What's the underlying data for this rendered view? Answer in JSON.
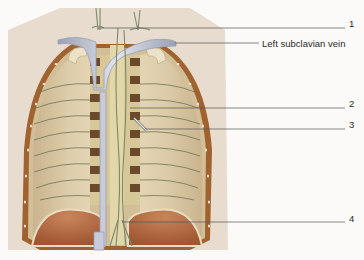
{
  "figure": {
    "colors": {
      "background": "#fbfaf8",
      "backdrop": "#e7dccd",
      "pleura": "#d9c8a6",
      "pleura_dark": "#c8b38c",
      "rib_border": "#a0622e",
      "vein": "#c9ccd8",
      "vein_shadow": "#9aa0b4",
      "vertebra_dark": "#6a4a2a",
      "spine": "#d7c89a",
      "diaphragm": "#b56c3e",
      "nerve": "#5a6a4a",
      "leader_line": "#555555"
    }
  },
  "labels": [
    {
      "id": "1",
      "text": "1",
      "x": 349,
      "y": 19,
      "line_from": [
        98,
        28
      ],
      "line_to": [
        345,
        28
      ]
    },
    {
      "id": "left-subclavian-vein",
      "text": "Left subclavian vein",
      "x": 262,
      "y": 39,
      "line_from": [
        175,
        43
      ],
      "line_to": [
        259,
        43
      ]
    },
    {
      "id": "2",
      "text": "2",
      "x": 349,
      "y": 99,
      "line_from": [
        130,
        108
      ],
      "line_to": [
        345,
        108
      ]
    },
    {
      "id": "3",
      "text": "3",
      "x": 349,
      "y": 120,
      "line_from": [
        145,
        129
      ],
      "line_to": [
        345,
        129
      ]
    },
    {
      "id": "4",
      "text": "4",
      "x": 349,
      "y": 214,
      "line_from": [
        122,
        222
      ],
      "line_to": [
        345,
        222
      ]
    }
  ]
}
